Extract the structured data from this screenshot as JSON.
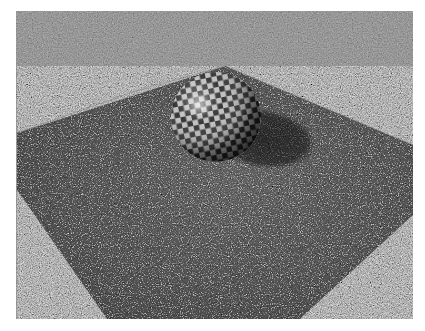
{
  "scene": {
    "description": "Ray-traced render of a checkered sphere resting on a granite-textured square plane against a dark background",
    "background_color": "#1c1c1c",
    "plane": {
      "texture": "granite",
      "base_color": "#5a5a5a",
      "polygon": [
        [
          209,
          55
        ],
        [
          397,
          134
        ],
        [
          397,
          204
        ],
        [
          284,
          308
        ],
        [
          91,
          308
        ],
        [
          1,
          179
        ],
        [
          1,
          122
        ]
      ]
    },
    "sphere": {
      "texture": "checkerboard",
      "center": [
        200,
        106
      ],
      "radius": 45,
      "highlight": [
        182,
        94
      ],
      "light_color": "#cfcfcf",
      "dark_color": "#2a2a2a"
    },
    "shadow": {
      "center": [
        248,
        130
      ],
      "rx": 50,
      "ry": 30
    }
  }
}
